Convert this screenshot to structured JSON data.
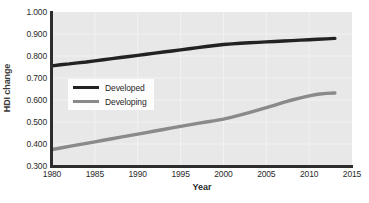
{
  "chart_data": {
    "type": "line",
    "title": "",
    "xlabel": "Year",
    "ylabel": "HDI change",
    "xlim": [
      1980,
      2015
    ],
    "ylim": [
      0.3,
      1.0
    ],
    "xticks": [
      1980,
      1985,
      1990,
      1995,
      2000,
      2005,
      2010,
      2015
    ],
    "xtick_labels": [
      "1980",
      "1985",
      "1990",
      "1995",
      "2000",
      "2005",
      "2010",
      "2015"
    ],
    "yticks": [
      0.3,
      0.4,
      0.5,
      0.6,
      0.7,
      0.8,
      0.9,
      1.0
    ],
    "ytick_labels": [
      "0.300",
      "0.400",
      "0.500",
      "0.600",
      "0.700",
      "0.800",
      "0.900",
      "1.000"
    ],
    "grid": true,
    "grid_color": "#f2f2f2",
    "plot_bgcolor": "#e8e8e8",
    "legend_position": "center-left",
    "x": [
      1980,
      1981,
      1982,
      1983,
      1984,
      1985,
      1986,
      1987,
      1988,
      1989,
      1990,
      1991,
      1992,
      1993,
      1994,
      1995,
      1996,
      1997,
      1998,
      1999,
      2000,
      2001,
      2002,
      2003,
      2004,
      2005,
      2006,
      2007,
      2008,
      2009,
      2010,
      2011,
      2012,
      2013
    ],
    "series": [
      {
        "name": "Developed",
        "color": "#222222",
        "values": [
          0.755,
          0.76,
          0.764,
          0.769,
          0.773,
          0.778,
          0.783,
          0.788,
          0.793,
          0.798,
          0.803,
          0.808,
          0.813,
          0.818,
          0.823,
          0.828,
          0.833,
          0.838,
          0.843,
          0.848,
          0.852,
          0.855,
          0.858,
          0.86,
          0.862,
          0.864,
          0.866,
          0.868,
          0.87,
          0.872,
          0.874,
          0.876,
          0.878,
          0.88
        ]
      },
      {
        "name": "Developing",
        "color": "#8a8a8a",
        "values": [
          0.375,
          0.382,
          0.389,
          0.396,
          0.403,
          0.41,
          0.417,
          0.424,
          0.431,
          0.438,
          0.445,
          0.452,
          0.459,
          0.466,
          0.473,
          0.48,
          0.487,
          0.494,
          0.5,
          0.506,
          0.513,
          0.522,
          0.532,
          0.543,
          0.554,
          0.565,
          0.577,
          0.589,
          0.6,
          0.61,
          0.619,
          0.626,
          0.63,
          0.632
        ]
      }
    ]
  },
  "legend": {
    "entries": [
      {
        "label": "Developed",
        "color": "#222222"
      },
      {
        "label": "Developing",
        "color": "#8a8a8a"
      }
    ]
  }
}
